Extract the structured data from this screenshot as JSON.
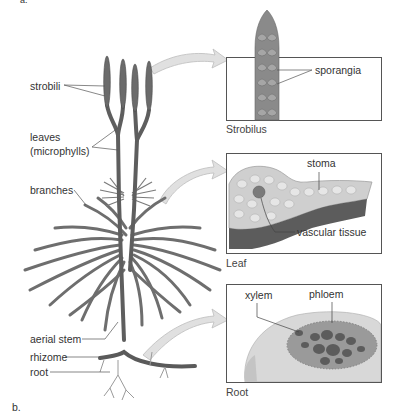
{
  "figure": {
    "part_a_label": "a.",
    "part_b_label": "b."
  },
  "plant_labels": {
    "strobili": "strobili",
    "leaves_line1": "leaves",
    "leaves_line2": "(microphylls)",
    "branches": "branches",
    "aerial_stem": "aerial stem",
    "rhizome": "rhizome",
    "root": "root"
  },
  "panels": {
    "strobilus": {
      "caption": "Strobilus",
      "labels": {
        "sporangia": "sporangia"
      }
    },
    "leaf": {
      "caption": "Leaf",
      "labels": {
        "stoma": "stoma",
        "vascular_tissue": "vascular tissue"
      }
    },
    "root": {
      "caption": "Root",
      "labels": {
        "xylem": "xylem",
        "phloem": "phloem"
      }
    }
  },
  "colors": {
    "stem": "#6a6a6a",
    "stem_dark": "#4a4a4a",
    "arrow": "#d9d9d9",
    "arrow_stroke": "#bdbdbd",
    "panel_border": "#555555",
    "leaf_top": "#cfcfcf",
    "leaf_bottom": "#5a5a5a",
    "root_outer": "#d4d4d4",
    "root_core": "#8a8a8a"
  }
}
